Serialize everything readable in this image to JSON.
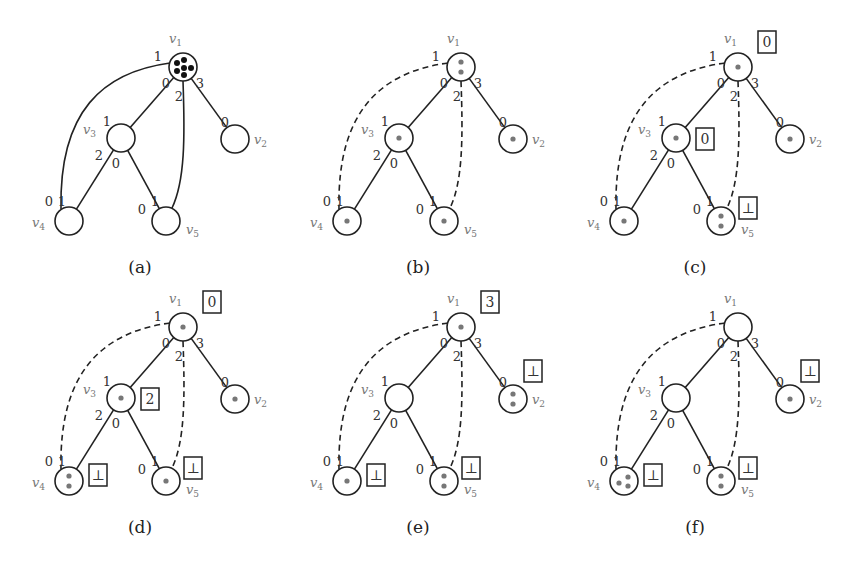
{
  "figure": {
    "vertex_names": [
      "v1",
      "v2",
      "v3",
      "v4",
      "v5"
    ],
    "edges": [
      {
        "from": "v1",
        "to": "v3",
        "port_from": "0",
        "port_to": "1"
      },
      {
        "from": "v1",
        "to": "v5",
        "port_from": "2",
        "port_to": "1"
      },
      {
        "from": "v1",
        "to": "v2",
        "port_from": "3",
        "port_to": "0"
      },
      {
        "from": "v1",
        "to": "v4",
        "port_from": "1",
        "port_to": "0"
      },
      {
        "from": "v3",
        "to": "v4",
        "port_from": "2",
        "port_to": "1"
      },
      {
        "from": "v3",
        "to": "v5",
        "port_from": "0",
        "port_to": "0"
      }
    ],
    "colors": {
      "line": "#222222",
      "dot_dark": "#111111",
      "dot_gray": "#777777",
      "label_gray": "#777777"
    },
    "panels": [
      {
        "caption": "(a)",
        "dashed_edges": [],
        "dot_style": "dark",
        "tokens": {
          "v1": 6,
          "v2": 0,
          "v3": 0,
          "v4": 0,
          "v5": 0
        },
        "boxes": {}
      },
      {
        "caption": "(b)",
        "dashed_edges": [
          "v1-v4",
          "v1-v5"
        ],
        "dot_style": "gray",
        "tokens": {
          "v1": 2,
          "v2": 1,
          "v3": 1,
          "v4": 1,
          "v5": 1
        },
        "boxes": {}
      },
      {
        "caption": "(c)",
        "dashed_edges": [
          "v1-v4",
          "v1-v5"
        ],
        "dot_style": "gray",
        "tokens": {
          "v1": 1,
          "v2": 1,
          "v3": 1,
          "v4": 1,
          "v5": 2
        },
        "boxes": {
          "v1": "0",
          "v3": "0",
          "v5": "⊥"
        }
      },
      {
        "caption": "(d)",
        "dashed_edges": [
          "v1-v4",
          "v1-v5"
        ],
        "dot_style": "gray",
        "tokens": {
          "v1": 1,
          "v2": 1,
          "v3": 1,
          "v4": 2,
          "v5": 1
        },
        "boxes": {
          "v1": "0",
          "v3": "2",
          "v4": "⊥",
          "v5": "⊥"
        }
      },
      {
        "caption": "(e)",
        "dashed_edges": [
          "v1-v4",
          "v1-v5"
        ],
        "dot_style": "gray",
        "tokens": {
          "v1": 1,
          "v2": 2,
          "v3": 0,
          "v4": 1,
          "v5": 2
        },
        "boxes": {
          "v1": "3",
          "v2": "⊥",
          "v4": "⊥",
          "v5": "⊥"
        }
      },
      {
        "caption": "(f)",
        "dashed_edges": [
          "v1-v4",
          "v1-v5"
        ],
        "dot_style": "gray",
        "tokens": {
          "v1": 0,
          "v2": 1,
          "v3": 0,
          "v4": 3,
          "v5": 2
        },
        "boxes": {
          "v2": "⊥",
          "v4": "⊥",
          "v5": "⊥"
        }
      }
    ]
  }
}
